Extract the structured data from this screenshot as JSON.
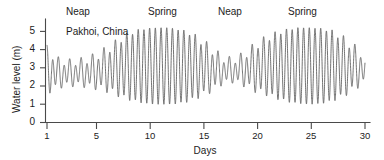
{
  "chart_data": {
    "type": "line",
    "title": "",
    "station_label": "Pakhoi, China",
    "xlabel": "Days",
    "ylabel": "Water level (m)",
    "xlim": [
      1,
      30
    ],
    "ylim": [
      0,
      5.6
    ],
    "grid": false,
    "legend": "none",
    "x_ticks": [
      1,
      5,
      10,
      15,
      20,
      25,
      30
    ],
    "x_tick_labels": [
      "1",
      "5",
      "10",
      "15",
      "20",
      "25",
      "30"
    ],
    "y_ticks": [
      0,
      1,
      2,
      3,
      4,
      5
    ],
    "y_tick_labels": [
      "0",
      "1",
      "2",
      "3",
      "4",
      "5"
    ],
    "annotations": [
      {
        "label": "Neap",
        "day": 3.0
      },
      {
        "label": "Spring",
        "day": 10.5
      },
      {
        "label": "Neap",
        "day": 17.0
      },
      {
        "label": "Spring",
        "day": 24.0
      }
    ],
    "series": [
      {
        "name": "Water level",
        "description": "Semidiurnal tide with spring-neap envelope; two neap periods near days 3 and 17, two spring periods near days 10.5 and 24.",
        "envelope_mean": 3.1,
        "amplitude_min": 0.75,
        "amplitude_max": 2.1,
        "tidal_period_days": 0.52,
        "x": [
          1,
          2,
          3,
          4,
          5,
          6,
          7,
          8,
          9,
          10,
          11,
          12,
          13,
          14,
          15,
          16,
          17,
          18,
          19,
          20,
          21,
          22,
          23,
          24,
          25,
          26,
          27,
          28,
          29,
          30
        ],
        "daily_high": [
          4.0,
          3.4,
          3.3,
          3.35,
          3.5,
          3.8,
          4.2,
          4.7,
          5.0,
          5.15,
          5.2,
          5.2,
          5.1,
          4.9,
          4.5,
          4.0,
          3.5,
          3.4,
          3.7,
          4.2,
          4.6,
          4.9,
          5.1,
          5.2,
          5.2,
          5.15,
          5.0,
          4.6,
          4.1,
          3.6
        ],
        "daily_low": [
          1.7,
          2.0,
          2.1,
          2.1,
          2.0,
          1.9,
          1.7,
          1.4,
          1.2,
          1.05,
          1.0,
          1.0,
          1.05,
          1.2,
          1.5,
          1.8,
          2.2,
          2.3,
          2.1,
          1.8,
          1.6,
          1.35,
          1.15,
          1.05,
          1.0,
          1.05,
          1.2,
          1.5,
          1.9,
          2.3
        ]
      }
    ]
  },
  "axis": {
    "y_title": "Water level (m)",
    "x_title": "Days"
  }
}
